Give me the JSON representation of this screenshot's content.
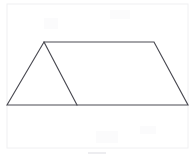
{
  "figure": {
    "type": "geometry-line-drawing",
    "canvas": {
      "width": 193,
      "height": 159,
      "background": "#ffffff"
    },
    "stroke_color": "#4a4a52",
    "stroke_width": 1.15,
    "fill_color": "#ffffff",
    "vertices": [
      {
        "name": "bottom-left",
        "x": 7,
        "y": 105
      },
      {
        "name": "top-left-apex",
        "x": 44,
        "y": 42
      },
      {
        "name": "top-right",
        "x": 154,
        "y": 42
      },
      {
        "name": "bottom-right",
        "x": 188,
        "y": 105
      },
      {
        "name": "base-interior-point",
        "x": 77,
        "y": 105
      }
    ],
    "outline_path": "M 7 105 L 44 42 L 154 42 L 188 105 Z",
    "interior_segments": [
      {
        "name": "interior-diagonal",
        "from": "top-left-apex",
        "to": "base-interior-point",
        "path": "M 44 42 L 77 105"
      }
    ],
    "edges": [
      {
        "name": "left-slant-edge",
        "from": "bottom-left",
        "to": "top-left-apex"
      },
      {
        "name": "top-edge",
        "from": "top-left-apex",
        "to": "top-right"
      },
      {
        "name": "right-slant-edge",
        "from": "top-right",
        "to": "bottom-right"
      },
      {
        "name": "base-edge",
        "from": "bottom-right",
        "to": "bottom-left"
      }
    ],
    "regions": [
      {
        "name": "left-triangle",
        "path": "M 7 105 L 44 42 L 77 105 Z"
      },
      {
        "name": "right-trapezoid",
        "path": "M 77 105 L 44 42 L 154 42 L 188 105 Z"
      }
    ],
    "scan_artifacts": {
      "frame_color": "#f0f0f2",
      "frame": {
        "x": 7,
        "y": 4,
        "width": 181,
        "height": 144
      },
      "bottom_smudge": {
        "x": 88,
        "y": 152,
        "width": 18,
        "height": 2,
        "color": "#ededf0"
      },
      "blotches": [
        {
          "x": 44,
          "y": 18,
          "width": 14,
          "height": 11,
          "color": "#fbfbfc"
        },
        {
          "x": 110,
          "y": 10,
          "width": 20,
          "height": 9,
          "color": "#fbfbfc"
        },
        {
          "x": 96,
          "y": 131,
          "width": 22,
          "height": 12,
          "color": "#fbfbfc"
        },
        {
          "x": 140,
          "y": 126,
          "width": 16,
          "height": 8,
          "color": "#fbfbfc"
        }
      ]
    },
    "labels": []
  }
}
